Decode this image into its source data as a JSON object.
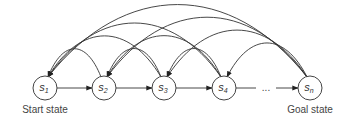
{
  "diagram": {
    "nodes": [
      {
        "id": "s1",
        "base": "s",
        "sub": "1",
        "caption": "Start state"
      },
      {
        "id": "s2",
        "base": "s",
        "sub": "2",
        "caption": ""
      },
      {
        "id": "s3",
        "base": "s",
        "sub": "3",
        "caption": ""
      },
      {
        "id": "s4",
        "base": "s",
        "sub": "4",
        "caption": ""
      },
      {
        "id": "sn",
        "base": "s",
        "sub": "n",
        "caption": "Goal state"
      }
    ],
    "ellipsis": "...",
    "forward_edges": [
      {
        "from": "s1",
        "to": "s2"
      },
      {
        "from": "s2",
        "to": "s3"
      },
      {
        "from": "s3",
        "to": "s4"
      },
      {
        "from": "s4",
        "to": "ellipsis"
      },
      {
        "from": "ellipsis",
        "to": "sn"
      }
    ],
    "backward_edges": [
      {
        "from": "s2",
        "to": "s1"
      },
      {
        "from": "s3",
        "to": "s1"
      },
      {
        "from": "s3",
        "to": "s2"
      },
      {
        "from": "s4",
        "to": "s1"
      },
      {
        "from": "s4",
        "to": "s2"
      },
      {
        "from": "s4",
        "to": "s3"
      },
      {
        "from": "sn",
        "to": "s1"
      },
      {
        "from": "sn",
        "to": "s2"
      },
      {
        "from": "sn",
        "to": "s3"
      },
      {
        "from": "sn",
        "to": "s4"
      }
    ],
    "colors": {
      "stroke": "#333333",
      "text": "#444444"
    }
  }
}
